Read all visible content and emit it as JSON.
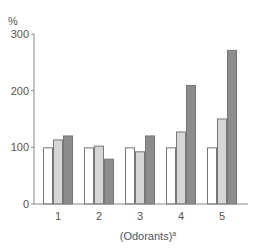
{
  "chart_data": {
    "type": "bar",
    "title": "",
    "xlabel": "(Odorants)",
    "xlabel_superscript": "a",
    "ylabel": "%",
    "ylim": [
      0,
      300
    ],
    "yticks": [
      0,
      100,
      200,
      300
    ],
    "grid": false,
    "legend": null,
    "categories": [
      "1",
      "2",
      "3",
      "4",
      "5"
    ],
    "series": [
      {
        "name": "series-1 (white)",
        "color": "#ffffff",
        "values": [
          100,
          100,
          100,
          100,
          100
        ]
      },
      {
        "name": "series-2 (light gray)",
        "color": "#d6d6d6",
        "values": [
          114,
          103,
          93,
          128,
          151
        ]
      },
      {
        "name": "series-3 (dark gray)",
        "color": "#8c8c8c",
        "values": [
          121,
          80,
          121,
          210,
          272
        ]
      }
    ]
  },
  "axis": {
    "y_unit": "%",
    "y_tick_labels": [
      "0",
      "100",
      "200",
      "300"
    ],
    "x_title": "(Odorants)",
    "x_title_sup": "a"
  },
  "colors": {
    "axis": "#888888",
    "bar_stroke": "#777777",
    "text": "#555555"
  }
}
